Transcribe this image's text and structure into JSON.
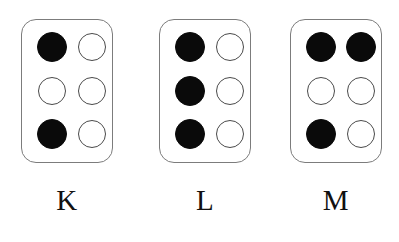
{
  "figure": {
    "name": "braille-letter-cells",
    "background_color": "#ffffff",
    "cell_border_color": "#7c7c7c",
    "raised_dot_color": "#0a0a0a",
    "flat_dot_border_color": "#4a4a4a",
    "flat_dot_fill_color": "#ffffff",
    "label_color": "#111111"
  },
  "cells": [
    {
      "label": "K",
      "dot_numbers_raised": [
        1,
        3
      ],
      "dots": [
        {
          "position": "dot-1",
          "row": 0,
          "col": 0,
          "state": "raised"
        },
        {
          "position": "dot-4",
          "row": 0,
          "col": 1,
          "state": "flat"
        },
        {
          "position": "dot-2",
          "row": 1,
          "col": 0,
          "state": "flat"
        },
        {
          "position": "dot-5",
          "row": 1,
          "col": 1,
          "state": "flat"
        },
        {
          "position": "dot-3",
          "row": 2,
          "col": 0,
          "state": "raised"
        },
        {
          "position": "dot-6",
          "row": 2,
          "col": 1,
          "state": "flat"
        }
      ]
    },
    {
      "label": "L",
      "dot_numbers_raised": [
        1,
        2,
        3
      ],
      "dots": [
        {
          "position": "dot-1",
          "row": 0,
          "col": 0,
          "state": "raised"
        },
        {
          "position": "dot-4",
          "row": 0,
          "col": 1,
          "state": "flat"
        },
        {
          "position": "dot-2",
          "row": 1,
          "col": 0,
          "state": "raised"
        },
        {
          "position": "dot-5",
          "row": 1,
          "col": 1,
          "state": "flat"
        },
        {
          "position": "dot-3",
          "row": 2,
          "col": 0,
          "state": "raised"
        },
        {
          "position": "dot-6",
          "row": 2,
          "col": 1,
          "state": "flat"
        }
      ]
    },
    {
      "label": "M",
      "dot_numbers_raised": [
        1,
        3,
        4
      ],
      "dots": [
        {
          "position": "dot-1",
          "row": 0,
          "col": 0,
          "state": "raised"
        },
        {
          "position": "dot-4",
          "row": 0,
          "col": 1,
          "state": "raised"
        },
        {
          "position": "dot-2",
          "row": 1,
          "col": 0,
          "state": "flat"
        },
        {
          "position": "dot-5",
          "row": 1,
          "col": 1,
          "state": "flat"
        },
        {
          "position": "dot-3",
          "row": 2,
          "col": 0,
          "state": "raised"
        },
        {
          "position": "dot-6",
          "row": 2,
          "col": 1,
          "state": "flat"
        }
      ]
    }
  ]
}
